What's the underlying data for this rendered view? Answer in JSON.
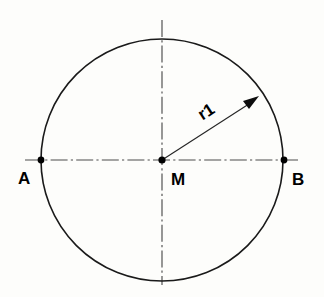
{
  "figure": {
    "background_color": "#fdfdfb",
    "line_color": "#1a1a1a",
    "centerline_color": "#4d4d4d",
    "width": 324,
    "height": 297
  },
  "geometry": {
    "circle": {
      "center_x": 162,
      "center_y": 160,
      "radius": 121
    },
    "horizontal_centerline": {
      "x1": 25,
      "y1": 160,
      "x2": 300,
      "y2": 160
    },
    "vertical_centerline": {
      "x1": 162,
      "y1": 20,
      "x2": 162,
      "y2": 285
    },
    "radius_leader": {
      "x1": 162,
      "y1": 160,
      "x2": 256,
      "y2": 99,
      "angle_deg": -33
    }
  },
  "points": [
    {
      "id": "point-a",
      "label": "A",
      "x": 41,
      "y": 160,
      "label_x": 24,
      "label_y": 180
    },
    {
      "id": "point-m",
      "label": "M",
      "x": 162,
      "y": 160,
      "label_x": 172,
      "label_y": 181
    },
    {
      "id": "point-b",
      "label": "B",
      "x": 284,
      "y": 160,
      "label_x": 292,
      "label_y": 181
    }
  ],
  "dimensions": [
    {
      "id": "radius-r1",
      "label": "r1",
      "label_x": 200,
      "label_y": 117,
      "rotation_deg": -33
    }
  ]
}
